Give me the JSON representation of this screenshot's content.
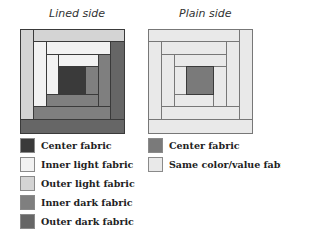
{
  "colors": {
    "center_dark": "#3a3a3a",
    "inner_light": "#f2f2f2",
    "outer_light": "#d4d4d4",
    "inner_dark": "#7f7f7f",
    "outer_dark": "#666666",
    "plain_center": "#7a7a7a",
    "plain_same": "#e9e9e9"
  },
  "lined": {
    "title": "Lined side",
    "legend": [
      {
        "label": "Center fabric",
        "swatch": "center_dark"
      },
      {
        "label": "Inner light fabric",
        "swatch": "inner_light"
      },
      {
        "label": "Outer light fabric",
        "swatch": "outer_light"
      },
      {
        "label": "Inner dark fabric",
        "swatch": "inner_dark"
      },
      {
        "label": "Outer dark fabric",
        "swatch": "outer_dark"
      }
    ]
  },
  "plain": {
    "title": "Plain side",
    "legend": [
      {
        "label": "Center fabric",
        "swatch": "plain_center"
      },
      {
        "label": "Same color/value fabrics",
        "swatch": "plain_same"
      }
    ]
  }
}
